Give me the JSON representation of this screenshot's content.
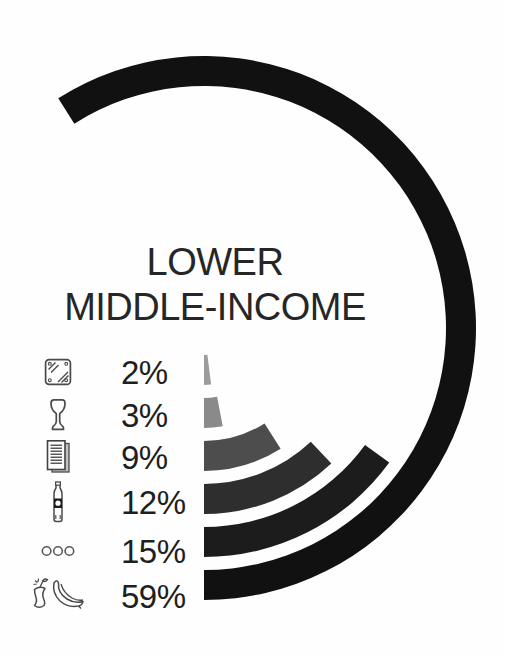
{
  "title": {
    "line1": "LOWER",
    "line2": "MIDDLE-INCOME"
  },
  "legend": {
    "rows": [
      {
        "category": "metal",
        "icon": "metal-icon",
        "label": "2%"
      },
      {
        "category": "glass",
        "icon": "glass-icon",
        "label": "3%"
      },
      {
        "category": "paper",
        "icon": "paper-icon",
        "label": "9%"
      },
      {
        "category": "plastic",
        "icon": "plastic-bottle-icon",
        "label": "12%"
      },
      {
        "category": "other",
        "icon": "other-dots-icon",
        "label": "15%"
      },
      {
        "category": "organic",
        "icon": "organic-waste-icon",
        "label": "59%"
      }
    ]
  },
  "chart_data": {
    "type": "radial-bar",
    "title": "LOWER MIDDLE-INCOME",
    "categories": [
      "metal",
      "glass",
      "paper",
      "plastic",
      "other",
      "organic/food waste"
    ],
    "values": [
      2,
      3,
      9,
      12,
      15,
      59
    ],
    "labels": [
      "2%",
      "3%",
      "9%",
      "12%",
      "15%",
      "59%"
    ],
    "unit": "%",
    "value_total": 100,
    "sweep_degrees": [
      7.2,
      10.8,
      32.4,
      43.2,
      54.0,
      212.4
    ],
    "start_position": "arcs start at 6 o'clock with a vertical cut and sweep up around the right side; radius grows with value",
    "legend_position": "left column, icon + percentage per ring",
    "grid": false,
    "colors": [
      "#9c9c9c",
      "#8a8a8a",
      "#4d4d4d",
      "#2e2e2e",
      "#1c1c1c",
      "#111111"
    ],
    "geometry": {
      "center_x": 204,
      "center_y": 328,
      "inner_radius_first_ring": 27,
      "ring_thickness": 30,
      "ring_gap": 13
    }
  }
}
